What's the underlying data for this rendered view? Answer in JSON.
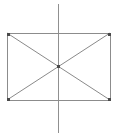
{
  "canvas": {
    "width": 119,
    "height": 138,
    "background_color": "#ffffff",
    "title": "Rectangle with diagonals and vertical axis"
  },
  "style": {
    "rectangle_stroke_color": "#8c8c8c",
    "diagonal_stroke_color": "#8a8a8a",
    "axis_stroke_color": "#909090",
    "marker_fill_color": "#4a4a4a",
    "rectangle_stroke_width": 1,
    "diagonal_stroke_width": 1,
    "axis_stroke_width": 1.4,
    "marker_size": 3
  },
  "shapes": {
    "rectangle": {
      "name": "rectangle",
      "x": 7,
      "y": 33,
      "width": 103,
      "height": 67,
      "left": 7,
      "top": 33,
      "right": 110,
      "bottom": 100,
      "fill": "none"
    },
    "diagonal_tl_br": {
      "name": "diagonal-top-left-to-bottom-right",
      "x1": 7,
      "y1": 33,
      "x2": 110,
      "y2": 100
    },
    "diagonal_bl_tr": {
      "name": "diagonal-bottom-left-to-top-right",
      "x1": 7,
      "y1": 100,
      "x2": 110,
      "y2": 33
    },
    "vertical_axis": {
      "name": "vertical-axis-line",
      "x1": 58.5,
      "y1": 4,
      "x2": 58.5,
      "y2": 133
    }
  },
  "markers": [
    {
      "name": "corner-marker-top-left",
      "cx": 8,
      "cy": 34
    },
    {
      "name": "corner-marker-top-right",
      "cx": 109,
      "cy": 34
    },
    {
      "name": "corner-marker-bottom-left",
      "cx": 8,
      "cy": 99
    },
    {
      "name": "corner-marker-bottom-right",
      "cx": 109,
      "cy": 99
    },
    {
      "name": "center-intersection-marker",
      "cx": 58.5,
      "cy": 66.5
    }
  ],
  "chart_data": {
    "type": "diagram",
    "elements": [
      "rectangle outline",
      "diagonal top-left to bottom-right",
      "diagonal bottom-left to top-right",
      "vertical center axis extending beyond rectangle"
    ],
    "intersection_point": [
      58.5,
      66.5
    ]
  }
}
